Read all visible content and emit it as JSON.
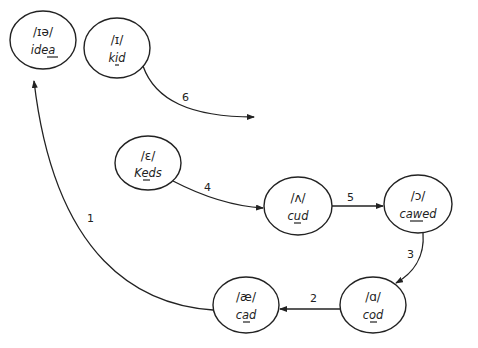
{
  "diagram": {
    "type": "vowel-shift-chain",
    "nodes": [
      {
        "id": "idea",
        "ipa": "/ɪə/",
        "word": "idea",
        "underlined": "ea",
        "cx": 43,
        "cy": 40,
        "rx": 33,
        "ry": 29
      },
      {
        "id": "kid",
        "ipa": "/ɪ/",
        "word": "kid",
        "underlined": "i",
        "cx": 117,
        "cy": 48,
        "rx": 33,
        "ry": 30
      },
      {
        "id": "Keds",
        "ipa": "/ɛ/",
        "word": "Keds",
        "underlined": "e",
        "cx": 148,
        "cy": 163,
        "rx": 33,
        "ry": 27
      },
      {
        "id": "cud",
        "ipa": "/ʌ/",
        "word": "cud",
        "underlined": "u",
        "cx": 298,
        "cy": 206,
        "rx": 34,
        "ry": 29
      },
      {
        "id": "cawed",
        "ipa": "/ɔ/",
        "word": "cawed",
        "underlined": "aw",
        "cx": 418,
        "cy": 204,
        "rx": 34,
        "ry": 29
      },
      {
        "id": "cod",
        "ipa": "/ɑ/",
        "word": "cod",
        "underlined": "o",
        "cx": 373,
        "cy": 305,
        "rx": 33,
        "ry": 28
      },
      {
        "id": "cad",
        "ipa": "/æ/",
        "word": "cad",
        "underlined": "a",
        "cx": 246,
        "cy": 305,
        "rx": 33,
        "ry": 28
      }
    ],
    "edges": [
      {
        "label": "1",
        "from": "cad",
        "to": "idea"
      },
      {
        "label": "2",
        "from": "cod",
        "to": "cad"
      },
      {
        "label": "3",
        "from": "cawed",
        "to": "cod"
      },
      {
        "label": "4",
        "from": "Keds",
        "to": "cud"
      },
      {
        "label": "5",
        "from": "cud",
        "to": "cawed"
      },
      {
        "label": "6",
        "from": "kid",
        "to": "open-end"
      }
    ]
  },
  "labels": {
    "n0": {
      "ipa": "/ɪə/",
      "pre": "id",
      "u": "ea",
      "post": ""
    },
    "n1": {
      "ipa": "/ɪ/",
      "pre": "k",
      "u": "i",
      "post": "d"
    },
    "n2": {
      "ipa": "/ɛ/",
      "pre": "K",
      "u": "e",
      "post": "ds"
    },
    "n3": {
      "ipa": "/ʌ/",
      "pre": "c",
      "u": "u",
      "post": "d"
    },
    "n4": {
      "ipa": "/ɔ/",
      "pre": "c",
      "u": "aw",
      "post": "ed"
    },
    "n5": {
      "ipa": "/ɑ/",
      "pre": "c",
      "u": "o",
      "post": "d"
    },
    "n6": {
      "ipa": "/æ/",
      "pre": "c",
      "u": "a",
      "post": "d"
    },
    "e1": "1",
    "e2": "2",
    "e3": "3",
    "e4": "4",
    "e5": "5",
    "e6": "6"
  }
}
